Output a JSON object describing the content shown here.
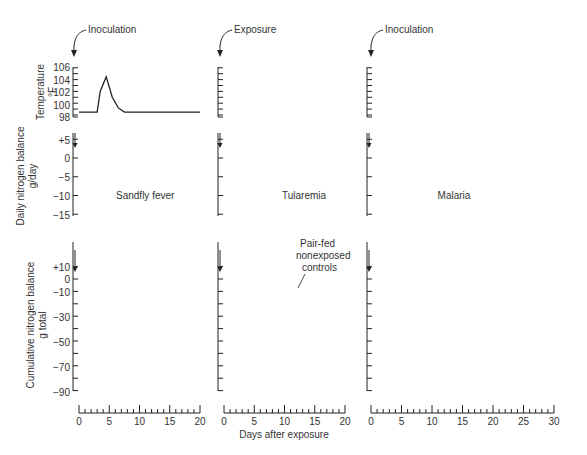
{
  "figure": {
    "xlabel": "Days after exposure",
    "ylabels": {
      "temperature": [
        "Temperature",
        "°F"
      ],
      "daily": [
        "Daily nitrogen balance",
        "g/day"
      ],
      "cumulative": [
        "Cumulative nitrogen balance",
        "g total"
      ]
    },
    "temp_ticks": [
      "106",
      "104",
      "102",
      "100",
      "98"
    ],
    "daily_ticks": [
      "+5",
      "0",
      "−5",
      "−10",
      "−15"
    ],
    "cum_ticks": [
      "+10",
      "0",
      "−10",
      "−30",
      "−50",
      "−70",
      "−90"
    ],
    "annotation_controls": [
      "Pair-fed",
      "nonexposed",
      "controls"
    ]
  },
  "chart_data": [
    {
      "type": "line",
      "panel": "sandfly-temperature",
      "event": "Inoculation",
      "ylabel": "Temperature °F",
      "ylim": [
        98,
        106
      ],
      "x": [
        0,
        3,
        3.5,
        4.5,
        5.5,
        6.5,
        7.5,
        20
      ],
      "values": [
        98.5,
        98.5,
        102,
        104.5,
        101,
        99.2,
        98.5,
        98.5
      ]
    },
    {
      "type": "bar",
      "panel": "sandfly-daily-nitrogen",
      "label": "Sandfly fever",
      "ylabel": "Daily nitrogen balance g/day",
      "ylim": [
        -15,
        5
      ],
      "x": [
        0,
        1,
        2,
        3,
        4,
        5,
        6,
        7,
        8,
        9,
        10,
        11,
        12,
        13,
        14,
        15,
        16,
        17,
        18,
        19
      ],
      "values": [
        1,
        1,
        2,
        1,
        -7,
        -3,
        -4,
        -1,
        -1,
        -1,
        -1,
        1,
        1,
        3,
        2,
        2,
        2,
        3,
        2,
        1
      ]
    },
    {
      "type": "line",
      "panel": "sandfly-cumulative-nitrogen",
      "ylabel": "Cumulative nitrogen balance g total",
      "ylim": [
        -90,
        10
      ],
      "x": [
        0,
        1,
        2,
        3,
        4,
        5,
        6,
        7,
        8,
        9,
        10,
        11,
        12,
        13,
        14,
        15,
        16,
        17,
        18,
        19,
        20
      ],
      "values": [
        0,
        2,
        4,
        3,
        -4,
        -11,
        -14,
        -16,
        -17,
        -18,
        -17,
        -16,
        -14,
        -12,
        -10,
        -8,
        -6,
        -4,
        -1,
        1,
        2
      ]
    },
    {
      "type": "line",
      "panel": "tularemia-temperature",
      "event": "Exposure",
      "ylim": [
        98,
        106
      ],
      "x": [
        0,
        1.5,
        4.5,
        5.5,
        7,
        8,
        9.5,
        10.5,
        20
      ],
      "values": [
        98.5,
        98.5,
        100.5,
        105,
        103.5,
        101.5,
        100,
        98.5,
        98.5
      ]
    },
    {
      "type": "bar",
      "panel": "tularemia-daily-nitrogen",
      "label": "Tularemia",
      "ylim": [
        -15,
        5
      ],
      "x": [
        0,
        1,
        2,
        3,
        4,
        5,
        6,
        7,
        8,
        9,
        10,
        11,
        12,
        13
      ],
      "values": [
        1,
        1,
        1,
        -5,
        -14,
        -13,
        -12,
        -11,
        -10,
        -7,
        -3,
        -2,
        -1,
        2
      ],
      "extra_bar": {
        "x": 11,
        "value": -1
      }
    },
    {
      "type": "line",
      "panel": "tularemia-cumulative-nitrogen",
      "annotation": "Pair-fed nonexposed controls",
      "ylim": [
        -90,
        10
      ],
      "series": [
        {
          "name": "Exposed",
          "x": [
            0,
            1,
            2,
            3,
            4,
            5,
            6,
            7,
            8,
            9,
            10,
            11,
            12,
            13
          ],
          "values": [
            0,
            1,
            2,
            2,
            -5,
            -20,
            -33,
            -40,
            -46,
            -50,
            -52,
            -53,
            -52,
            -51
          ]
        },
        {
          "name": "Pair-fed nonexposed controls",
          "x": [
            0,
            1,
            2,
            3,
            4,
            5,
            6,
            7,
            8,
            9,
            10,
            11,
            12,
            13,
            14,
            15,
            16,
            17,
            18
          ],
          "values": [
            0,
            1,
            2,
            2,
            0,
            -8,
            -12,
            -15,
            -17,
            -17,
            -16,
            -14,
            -11,
            -8,
            -4,
            -1,
            1,
            3,
            5
          ]
        }
      ]
    },
    {
      "type": "line",
      "panel": "malaria-temperature",
      "event": "Inoculation",
      "ylim": [
        98,
        106
      ],
      "note": "10 periodic fever spikes (~every 3 days) from 98.5 to ~105.5",
      "spike_days": [
        1.3,
        4.3,
        7.3,
        10.3,
        13.3,
        16.3,
        19.3,
        22.3,
        25.3,
        28.3
      ],
      "base": 98.5,
      "peak": 105.5
    },
    {
      "type": "bar",
      "panel": "malaria-daily-nitrogen",
      "label": "Malaria",
      "ylim": [
        -15,
        5
      ],
      "x": [
        0,
        1,
        2,
        3,
        4,
        5,
        6,
        7,
        8,
        9,
        10,
        11,
        12,
        13,
        14,
        15,
        16,
        17,
        18,
        19,
        20,
        21,
        22,
        23,
        24,
        25,
        26,
        27,
        28,
        29
      ],
      "values": [
        -1,
        -2,
        -12,
        -8,
        -4,
        -10,
        -7,
        -5,
        -9,
        -6,
        -2,
        -9,
        -2,
        -2,
        -6,
        -2,
        -1,
        -4,
        -1,
        -1,
        -2,
        -1,
        -1,
        -1,
        -0.5,
        0,
        -0.3,
        0,
        -0.3,
        -0.3
      ]
    },
    {
      "type": "area",
      "panel": "malaria-cumulative-nitrogen",
      "ylim": [
        -90,
        10
      ],
      "x": [
        0,
        1,
        2,
        3,
        4,
        5,
        6,
        7,
        8,
        9,
        10,
        11,
        12,
        13,
        14,
        15,
        16,
        17,
        18,
        19,
        20,
        21,
        22,
        23,
        24,
        25,
        26,
        27,
        28,
        29,
        30
      ],
      "values": [
        0,
        -1,
        -13,
        -21,
        -23,
        -27,
        -35,
        -40,
        -43,
        -48,
        -55,
        -59,
        -67,
        -69,
        -70,
        -75,
        -77,
        -80,
        -81,
        -83,
        -84,
        -85,
        -86,
        -87,
        -88,
        -89,
        -89,
        -90,
        -90,
        -91,
        -91
      ]
    }
  ]
}
